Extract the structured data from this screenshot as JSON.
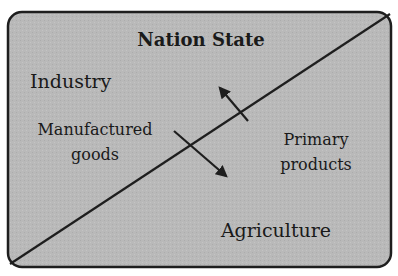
{
  "diagram": {
    "title": "Nation State",
    "regions": {
      "upper_left": "Industry",
      "lower_right": "Agriculture"
    },
    "flows": [
      {
        "label_lines": [
          "Manufactured",
          "goods"
        ],
        "direction": "Industry to Agriculture"
      },
      {
        "label_lines": [
          "Primary",
          "products"
        ],
        "direction": "Agriculture to Industry"
      }
    ]
  },
  "colors": {
    "background": "#b8b8b8",
    "border": "#1e1e1e",
    "line": "#1e1e1e",
    "text": "#1a1a1a"
  }
}
